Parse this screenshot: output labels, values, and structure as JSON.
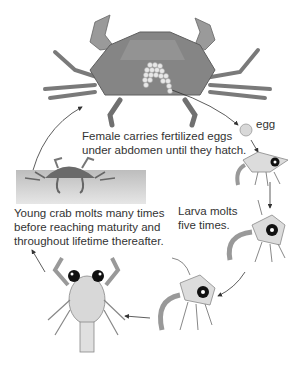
{
  "diagram": {
    "labels": {
      "adult": "Female carries fertilized eggs\nunder abdomen until they hatch.",
      "adult_line1": "Female carries fertilized eggs",
      "adult_line2": "under abdomen until they hatch.",
      "egg": "egg",
      "larva_line1": "Larva molts",
      "larva_line2": "five times.",
      "young_line1": "Young crab molts many times",
      "young_line2": "before reaching maturity and",
      "young_line3": "throughout lifetime thereafter."
    },
    "stages": [
      "adult female crab",
      "egg",
      "larva (zoea)",
      "larva (zoea)",
      "larva (zoea)",
      "megalopa",
      "young crab"
    ],
    "colors": {
      "crab": "#8a8a8a",
      "crab_dark": "#5e5e5e",
      "larva": "#d8d8d8",
      "eye": "#111111",
      "ground": "#c8c8c8",
      "arrow": "#333333"
    }
  }
}
